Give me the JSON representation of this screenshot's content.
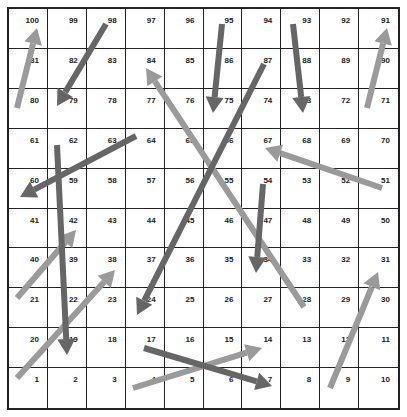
{
  "board": {
    "rows": 10,
    "cols": 10,
    "cell_numbers_top_to_bottom": [
      [
        100,
        99,
        98,
        97,
        96,
        95,
        94,
        93,
        92,
        91
      ],
      [
        81,
        82,
        83,
        84,
        85,
        86,
        87,
        88,
        89,
        90
      ],
      [
        80,
        79,
        78,
        77,
        76,
        75,
        74,
        73,
        72,
        71
      ],
      [
        61,
        62,
        63,
        64,
        65,
        66,
        67,
        68,
        69,
        70
      ],
      [
        60,
        59,
        58,
        57,
        56,
        55,
        54,
        53,
        52,
        51
      ],
      [
        41,
        42,
        43,
        44,
        45,
        46,
        47,
        48,
        49,
        50
      ],
      [
        40,
        39,
        38,
        37,
        36,
        35,
        34,
        33,
        32,
        31
      ],
      [
        21,
        22,
        23,
        24,
        25,
        26,
        27,
        28,
        29,
        30
      ],
      [
        20,
        19,
        18,
        17,
        16,
        15,
        14,
        13,
        12,
        11
      ],
      [
        1,
        2,
        3,
        4,
        5,
        6,
        7,
        8,
        9,
        10
      ]
    ]
  },
  "colors": {
    "snake": "#666666",
    "ladder": "#9a9a9a",
    "grid": "#222222"
  },
  "snakes": [
    {
      "from": 98,
      "to": 79,
      "x1": 106,
      "y1": 24,
      "x2": 57,
      "y2": 106
    },
    {
      "from": 95,
      "to": 75,
      "x1": 222,
      "y1": 24,
      "x2": 213,
      "y2": 113
    },
    {
      "from": 93,
      "to": 73,
      "x1": 293,
      "y1": 24,
      "x2": 303,
      "y2": 113
    },
    {
      "from": 87,
      "to": 24,
      "x1": 264,
      "y1": 64,
      "x2": 137,
      "y2": 315
    },
    {
      "from": 64,
      "to": 60,
      "x1": 136,
      "y1": 136,
      "x2": 20,
      "y2": 197
    },
    {
      "from": 62,
      "to": 19,
      "x1": 57,
      "y1": 145,
      "x2": 67,
      "y2": 355
    },
    {
      "from": 54,
      "to": 34,
      "x1": 263,
      "y1": 184,
      "x2": 256,
      "y2": 273
    },
    {
      "from": 17,
      "to": 7,
      "x1": 144,
      "y1": 348,
      "x2": 272,
      "y2": 386
    }
  ],
  "ladders": [
    {
      "from": 80,
      "to": 100,
      "x1": 17,
      "y1": 108,
      "x2": 37,
      "y2": 28
    },
    {
      "from": 71,
      "to": 91,
      "x1": 367,
      "y1": 108,
      "x2": 387,
      "y2": 28
    },
    {
      "from": 28,
      "to": 84,
      "x1": 304,
      "y1": 307,
      "x2": 146,
      "y2": 68
    },
    {
      "from": 51,
      "to": 67,
      "x1": 382,
      "y1": 188,
      "x2": 265,
      "y2": 148
    },
    {
      "from": 21,
      "to": 42,
      "x1": 17,
      "y1": 298,
      "x2": 76,
      "y2": 230
    },
    {
      "from": 1,
      "to": 38,
      "x1": 17,
      "y1": 378,
      "x2": 115,
      "y2": 270
    },
    {
      "from": 4,
      "to": 14,
      "x1": 133,
      "y1": 388,
      "x2": 262,
      "y2": 348
    },
    {
      "from": 9,
      "to": 31,
      "x1": 330,
      "y1": 388,
      "x2": 378,
      "y2": 272
    }
  ]
}
